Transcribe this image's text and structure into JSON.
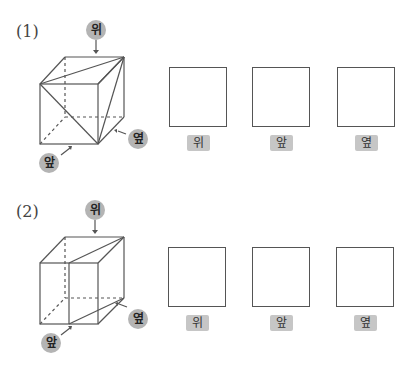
{
  "problems": [
    {
      "number": "(1)",
      "view_markers": {
        "top": "위",
        "front": "앞",
        "side": "옆"
      },
      "answer_boxes": [
        {
          "label": "위"
        },
        {
          "label": "앞"
        },
        {
          "label": "옆"
        }
      ]
    },
    {
      "number": "(2)",
      "view_markers": {
        "top": "위",
        "front": "앞",
        "side": "옆"
      },
      "answer_boxes": [
        {
          "label": "위"
        },
        {
          "label": "앞"
        },
        {
          "label": "옆"
        }
      ]
    }
  ],
  "colors": {
    "line": "#555555",
    "marker_badge": "#b4b4b4",
    "label_badge": "#c6c6c6"
  }
}
